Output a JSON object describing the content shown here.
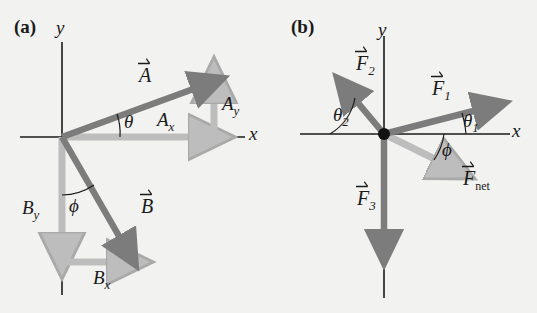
{
  "figure": {
    "background_color": "#f2f2f0",
    "dark_vector_color": "#7c7c7c",
    "light_vector_color": "#bdbdbd",
    "axis_color": "#1a1a1a",
    "text_color": "#1a1a1a"
  },
  "panels": [
    {
      "tag": "(a)",
      "axes": {
        "x_label": "x",
        "y_label": "y"
      },
      "vectors": [
        {
          "name": "A",
          "label": "A",
          "style": "dark",
          "has_overarrow": true
        },
        {
          "name": "B",
          "label": "B",
          "style": "dark",
          "has_overarrow": true
        },
        {
          "name": "Ax",
          "label": "A",
          "sub": "x",
          "style": "light",
          "has_overarrow": false
        },
        {
          "name": "Ay",
          "label": "A",
          "sub": "y",
          "style": "light",
          "has_overarrow": false
        },
        {
          "name": "Bx",
          "label": "B",
          "sub": "x",
          "style": "light",
          "has_overarrow": false
        },
        {
          "name": "By",
          "label": "B",
          "sub": "y",
          "style": "light",
          "has_overarrow": false
        }
      ],
      "angles": [
        {
          "name": "theta",
          "label": "θ"
        },
        {
          "name": "phi",
          "label": "ϕ"
        }
      ]
    },
    {
      "tag": "(b)",
      "axes": {
        "x_label": "x",
        "y_label": "y"
      },
      "vectors": [
        {
          "name": "F1",
          "label": "F",
          "sub": "1",
          "style": "dark",
          "has_overarrow": true
        },
        {
          "name": "F2",
          "label": "F",
          "sub": "2",
          "style": "dark",
          "has_overarrow": true
        },
        {
          "name": "F3",
          "label": "F",
          "sub": "3",
          "style": "dark",
          "has_overarrow": true
        },
        {
          "name": "Fnet",
          "label": "F",
          "sub": "net",
          "style": "light",
          "has_overarrow": true
        }
      ],
      "angles": [
        {
          "name": "theta1",
          "label": "θ",
          "sub": "1"
        },
        {
          "name": "theta2",
          "label": "θ",
          "sub": "2"
        },
        {
          "name": "phi",
          "label": "ϕ"
        }
      ]
    }
  ],
  "labels": {
    "panel_a_tag": "(a)",
    "panel_a_y": "y",
    "panel_a_x": "x",
    "vec_A": "A",
    "vec_B": "B",
    "comp_Ax_base": "A",
    "comp_Ax_sub": "x",
    "comp_Ay_base": "A",
    "comp_Ay_sub": "y",
    "comp_Bx_base": "B",
    "comp_Bx_sub": "x",
    "comp_By_base": "B",
    "comp_By_sub": "y",
    "angle_theta": "θ",
    "angle_phi_a": "ϕ",
    "panel_b_tag": "(b)",
    "panel_b_y": "y",
    "panel_b_x": "x",
    "vec_F1_base": "F",
    "vec_F1_sub": "1",
    "vec_F2_base": "F",
    "vec_F2_sub": "2",
    "vec_F3_base": "F",
    "vec_F3_sub": "3",
    "vec_Fnet_base": "F",
    "vec_Fnet_sub": "net",
    "angle_theta1_base": "θ",
    "angle_theta1_sub": "1",
    "angle_theta2_base": "θ",
    "angle_theta2_sub": "2",
    "angle_phi_b": "ϕ"
  }
}
